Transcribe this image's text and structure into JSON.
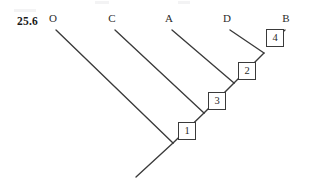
{
  "figure": {
    "number": "25.6",
    "background_color": "#ffffff",
    "line_color": "#3a3a3a",
    "text_color": "#2b2b2b"
  },
  "taxa": [
    {
      "label": "O",
      "x": 53,
      "y": 22
    },
    {
      "label": "C",
      "x": 112,
      "y": 22
    },
    {
      "label": "A",
      "x": 169,
      "y": 22
    },
    {
      "label": "D",
      "x": 227,
      "y": 22
    },
    {
      "label": "B",
      "x": 286,
      "y": 22
    }
  ],
  "nodes": [
    {
      "label": "1",
      "box_x": 178,
      "box_y": 122,
      "junction_x": 173,
      "junction_y": 143
    },
    {
      "label": "3",
      "box_x": 208,
      "box_y": 92,
      "junction_x": 204,
      "junction_y": 113
    },
    {
      "label": "2",
      "box_x": 238,
      "box_y": 62,
      "junction_x": 234,
      "junction_y": 83
    },
    {
      "label": "4",
      "box_x": 266,
      "box_y": 29,
      "junction_x": 264,
      "junction_y": 53
    }
  ],
  "branches": [
    {
      "name": "root-stem",
      "x1": 173,
      "y1": 143,
      "x2": 136,
      "y2": 177
    },
    {
      "name": "branch-O",
      "x1": 56,
      "y1": 30,
      "x2": 173,
      "y2": 143
    },
    {
      "name": "branch-C",
      "x1": 115,
      "y1": 30,
      "x2": 204,
      "y2": 113
    },
    {
      "name": "branch-A",
      "x1": 172,
      "y1": 30,
      "x2": 234,
      "y2": 83
    },
    {
      "name": "branch-D",
      "x1": 230,
      "y1": 30,
      "x2": 264,
      "y2": 53
    },
    {
      "name": "branch-B",
      "x1": 285,
      "y1": 30,
      "x2": 271,
      "y2": 43
    },
    {
      "name": "spine-1-3",
      "x1": 173,
      "y1": 143,
      "x2": 204,
      "y2": 113
    },
    {
      "name": "spine-3-2",
      "x1": 204,
      "y1": 113,
      "x2": 234,
      "y2": 83
    },
    {
      "name": "spine-2-4",
      "x1": 234,
      "y1": 83,
      "x2": 264,
      "y2": 53
    }
  ]
}
